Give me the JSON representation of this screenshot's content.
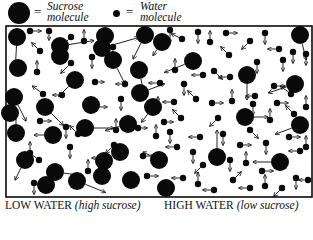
{
  "legend": {
    "sucrose_eq": "=",
    "sucrose_label_1": "Sucrose",
    "sucrose_label_2": "molecule",
    "water_eq": "=",
    "water_label_1": "Water",
    "water_label_2": "molecule"
  },
  "captions": {
    "left_main": "LOW WATER",
    "left_sub": "(high sucrose)",
    "right_main": "HIGH WATER",
    "right_sub": "(low sucrose)"
  },
  "colors": {
    "ink": "#0a0a0a",
    "background": "#ffffff"
  },
  "diagram": {
    "box": {
      "x": 6,
      "y": 26,
      "w": 306,
      "h": 171
    },
    "sucrose": [
      [
        17,
        37,
        -1,
        18
      ],
      [
        60,
        46,
        25,
        -4
      ],
      [
        105,
        36,
        0,
        0
      ],
      [
        113,
        60,
        8,
        16
      ],
      [
        145,
        35,
        -8,
        16
      ],
      [
        18,
        68,
        0,
        0
      ],
      [
        75,
        80,
        -10,
        10
      ],
      [
        139,
        70,
        3,
        14
      ],
      [
        102,
        48,
        28,
        -8
      ],
      [
        14,
        97,
        8,
        16
      ],
      [
        45,
        107,
        12,
        12
      ],
      [
        60,
        56,
        0,
        0
      ],
      [
        85,
        128,
        20,
        0
      ],
      [
        104,
        161,
        0,
        0
      ],
      [
        140,
        93,
        16,
        -6
      ],
      [
        16,
        133,
        0,
        -14
      ],
      [
        128,
        124,
        -14,
        4
      ],
      [
        25,
        160,
        -6,
        12
      ],
      [
        55,
        172,
        16,
        2
      ],
      [
        120,
        152,
        -12,
        6
      ],
      [
        77,
        181,
        20,
        8
      ],
      [
        131,
        180,
        0,
        0
      ],
      [
        10,
        113,
        0,
        0
      ],
      [
        46,
        185,
        0,
        0
      ],
      [
        159,
        160,
        -8,
        -4
      ],
      [
        162,
        42,
        -4,
        6
      ],
      [
        193,
        61,
        -20,
        8
      ],
      [
        153,
        107,
        -6,
        8
      ],
      [
        247,
        75,
        0,
        16
      ],
      [
        300,
        35,
        4,
        16
      ],
      [
        295,
        84,
        -18,
        6
      ],
      [
        217,
        157,
        0,
        -18
      ],
      [
        280,
        162,
        -18,
        0
      ],
      [
        245,
        117,
        14,
        0
      ],
      [
        300,
        125,
        -16,
        6
      ],
      [
        91,
        105,
        0,
        0
      ],
      [
        53,
        135,
        -10,
        0
      ],
      [
        166,
        188,
        0,
        0
      ],
      [
        102,
        176,
        0,
        0
      ]
    ],
    "water": [
      [
        30,
        31,
        8,
        0
      ],
      [
        49,
        31,
        0,
        6
      ],
      [
        71,
        37,
        -6,
        6
      ],
      [
        84,
        41,
        0,
        -8
      ],
      [
        37,
        72,
        0,
        -8
      ],
      [
        40,
        51,
        -6,
        -6
      ],
      [
        71,
        63,
        -8,
        8
      ],
      [
        92,
        57,
        0,
        8
      ],
      [
        107,
        53,
        -8,
        -6
      ],
      [
        113,
        47,
        0,
        8
      ],
      [
        95,
        82,
        6,
        0
      ],
      [
        125,
        84,
        -6,
        0
      ],
      [
        43,
        94,
        -8,
        -6
      ],
      [
        62,
        95,
        -6,
        0
      ],
      [
        121,
        99,
        0,
        8
      ],
      [
        96,
        107,
        8,
        0
      ],
      [
        66,
        127,
        0,
        8
      ],
      [
        116,
        130,
        0,
        -8
      ],
      [
        78,
        134,
        -6,
        -6
      ],
      [
        39,
        160,
        -8,
        -6
      ],
      [
        70,
        147,
        0,
        8
      ],
      [
        30,
        153,
        0,
        -8
      ],
      [
        103,
        158,
        -8,
        0
      ],
      [
        143,
        156,
        8,
        0
      ],
      [
        114,
        145,
        -6,
        6
      ],
      [
        40,
        121,
        8,
        0
      ],
      [
        138,
        128,
        6,
        0
      ],
      [
        147,
        176,
        8,
        0
      ],
      [
        34,
        183,
        0,
        8
      ],
      [
        88,
        171,
        0,
        -8
      ],
      [
        158,
        108,
        0,
        -8
      ],
      [
        160,
        83,
        -8,
        0
      ],
      [
        170,
        30,
        0,
        10
      ],
      [
        182,
        39,
        -8,
        -4
      ],
      [
        198,
        32,
        0,
        8
      ],
      [
        210,
        42,
        0,
        -8
      ],
      [
        226,
        33,
        8,
        0
      ],
      [
        250,
        41,
        -6,
        6
      ],
      [
        265,
        33,
        0,
        8
      ],
      [
        279,
        49,
        -8,
        0
      ],
      [
        293,
        52,
        0,
        8
      ],
      [
        229,
        55,
        -6,
        -6
      ],
      [
        257,
        62,
        0,
        8
      ],
      [
        283,
        60,
        0,
        8
      ],
      [
        306,
        54,
        0,
        8
      ],
      [
        175,
        70,
        0,
        -8
      ],
      [
        184,
        84,
        0,
        8
      ],
      [
        203,
        75,
        -8,
        0
      ],
      [
        214,
        71,
        6,
        6
      ],
      [
        230,
        77,
        -8,
        0
      ],
      [
        255,
        96,
        -6,
        0
      ],
      [
        274,
        86,
        8,
        0
      ],
      [
        291,
        94,
        -8,
        -6
      ],
      [
        306,
        107,
        0,
        -8
      ],
      [
        174,
        102,
        -8,
        0
      ],
      [
        196,
        99,
        -6,
        -6
      ],
      [
        212,
        103,
        8,
        0
      ],
      [
        232,
        101,
        0,
        -8
      ],
      [
        253,
        104,
        0,
        8
      ],
      [
        277,
        103,
        8,
        0
      ],
      [
        170,
        132,
        0,
        8
      ],
      [
        181,
        118,
        -6,
        -6
      ],
      [
        200,
        137,
        -8,
        0
      ],
      [
        223,
        134,
        0,
        8
      ],
      [
        250,
        130,
        6,
        6
      ],
      [
        266,
        143,
        0,
        8
      ],
      [
        289,
        137,
        8,
        0
      ],
      [
        306,
        147,
        0,
        -8
      ],
      [
        177,
        147,
        -8,
        0
      ],
      [
        193,
        152,
        0,
        8
      ],
      [
        203,
        165,
        -6,
        6
      ],
      [
        230,
        160,
        0,
        8
      ],
      [
        246,
        163,
        0,
        -8
      ],
      [
        262,
        171,
        8,
        0
      ],
      [
        300,
        151,
        -8,
        0
      ],
      [
        308,
        180,
        -6,
        0
      ],
      [
        183,
        178,
        -8,
        0
      ],
      [
        198,
        184,
        0,
        -8
      ],
      [
        214,
        190,
        -8,
        0
      ],
      [
        233,
        180,
        6,
        -6
      ],
      [
        250,
        188,
        -8,
        0
      ],
      [
        265,
        186,
        0,
        -8
      ],
      [
        282,
        188,
        -6,
        6
      ],
      [
        296,
        178,
        0,
        8
      ],
      [
        156,
        136,
        0,
        -8
      ],
      [
        164,
        122,
        6,
        0
      ],
      [
        218,
        118,
        -6,
        6
      ],
      [
        270,
        120,
        0,
        -8
      ],
      [
        240,
        145,
        8,
        0
      ],
      [
        294,
        114,
        -6,
        -6
      ]
    ]
  }
}
